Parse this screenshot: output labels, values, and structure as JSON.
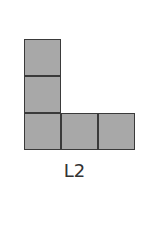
{
  "figure": {
    "label": "L2",
    "shape": "L-tromino-extended",
    "cell_size": 36,
    "fill_color": "#a8a8a8",
    "border_color": "#3a3a3a",
    "cells": [
      {
        "col": 0,
        "row": 0
      },
      {
        "col": 0,
        "row": 1
      },
      {
        "col": 0,
        "row": 2
      },
      {
        "col": 1,
        "row": 2
      },
      {
        "col": 2,
        "row": 2
      }
    ]
  }
}
